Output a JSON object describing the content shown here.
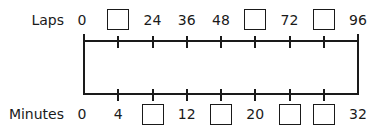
{
  "diagram": {
    "type": "double-number-line",
    "top_line": {
      "title": "Laps",
      "ticks": [
        {
          "label": "0",
          "blank": false
        },
        {
          "label": "",
          "blank": true
        },
        {
          "label": "24",
          "blank": false
        },
        {
          "label": "36",
          "blank": false
        },
        {
          "label": "48",
          "blank": false
        },
        {
          "label": "",
          "blank": true
        },
        {
          "label": "72",
          "blank": false
        },
        {
          "label": "",
          "blank": true
        },
        {
          "label": "96",
          "blank": false
        }
      ]
    },
    "bottom_line": {
      "title": "Minutes",
      "ticks": [
        {
          "label": "0",
          "blank": false
        },
        {
          "label": "4",
          "blank": false
        },
        {
          "label": "",
          "blank": true
        },
        {
          "label": "12",
          "blank": false
        },
        {
          "label": "",
          "blank": true
        },
        {
          "label": "20",
          "blank": false
        },
        {
          "label": "",
          "blank": true
        },
        {
          "label": "",
          "blank": true
        },
        {
          "label": "32",
          "blank": false
        }
      ]
    },
    "colors": {
      "ink": "#1a1a1a",
      "background": "#ffffff"
    }
  }
}
